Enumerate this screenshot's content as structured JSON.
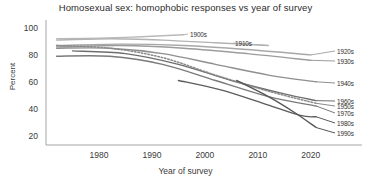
{
  "chart_data": {
    "type": "line",
    "title": "Homosexual sex: homophobic responses vs year of survey",
    "xlabel": "Year of survey",
    "ylabel": "Percent",
    "xlim": [
      1970,
      2024
    ],
    "ylim": [
      14,
      104
    ],
    "xticks": [
      "1980",
      "1990",
      "2000",
      "2010",
      "2020"
    ],
    "yticks": [
      "100",
      "80",
      "60",
      "40",
      "20"
    ],
    "grid": false,
    "legend_position": "right-inline",
    "series": [
      {
        "name": "1900s",
        "color": "#b9b9b9",
        "style": "solid",
        "label_x": 190,
        "label_y": 31,
        "x": [
          1972,
          1980,
          1988,
          1996
        ],
        "values": [
          93,
          93.5,
          94.5,
          96
        ]
      },
      {
        "name": "1910s",
        "color": "#b2b2b2",
        "style": "solid",
        "label_x": 235,
        "label_y": 40,
        "x": [
          1972,
          1982,
          1992,
          2002,
          2012
        ],
        "values": [
          92,
          93,
          92,
          90,
          88
        ]
      },
      {
        "name": "1920s",
        "color": "#a8a8a8",
        "style": "solid",
        "label_x": 337,
        "label_y": 48,
        "x": [
          1972,
          1984,
          1996,
          2008,
          2020
        ],
        "values": [
          88,
          89,
          88,
          85,
          81
        ]
      },
      {
        "name": "1930s",
        "color": "#9c9c9c",
        "style": "solid",
        "label_x": 337,
        "label_y": 58,
        "x": [
          1972,
          1984,
          1996,
          2008,
          2020
        ],
        "values": [
          87,
          88,
          86,
          82,
          77
        ]
      },
      {
        "name": "1940s",
        "color": "#8f8f8f",
        "style": "solid",
        "label_x": 337,
        "label_y": 80,
        "x": [
          1972,
          1982,
          1992,
          2002,
          2012,
          2021
        ],
        "values": [
          86,
          86,
          82,
          74,
          66,
          61
        ]
      },
      {
        "name": "1960s",
        "color": "#6e6e6e",
        "style": "solid",
        "label_x": 337,
        "label_y": 98,
        "x": [
          1975,
          1985,
          1995,
          2005,
          2015,
          2021
        ],
        "values": [
          84,
          82,
          74,
          62,
          52,
          47
        ]
      },
      {
        "name": "1950s",
        "color": "#8a8a8a",
        "style": "dotted",
        "label_x": 337,
        "label_y": 103,
        "x": [
          1972,
          1982,
          1992,
          2002,
          2012,
          2021
        ],
        "values": [
          88,
          86,
          79,
          66,
          54,
          45
        ]
      },
      {
        "name": "1970s",
        "color": "#7a7a7a",
        "style": "solid",
        "label_x": 337,
        "label_y": 110,
        "x": [
          1972,
          1982,
          1992,
          2002,
          2012,
          2021
        ],
        "values": [
          80,
          80,
          74,
          62,
          50,
          43
        ]
      },
      {
        "name": "1980s",
        "color": "#5c5c5c",
        "style": "solid",
        "label_x": 337,
        "label_y": 120,
        "x": [
          1995,
          2003,
          2011,
          2018,
          2021
        ],
        "values": [
          62,
          55,
          45,
          36,
          35
        ]
      },
      {
        "name": "1990s",
        "color": "#565656",
        "style": "solid",
        "label_x": 337,
        "label_y": 130,
        "x": [
          2006,
          2012,
          2017,
          2021
        ],
        "values": [
          62,
          50,
          38,
          27
        ]
      }
    ]
  }
}
